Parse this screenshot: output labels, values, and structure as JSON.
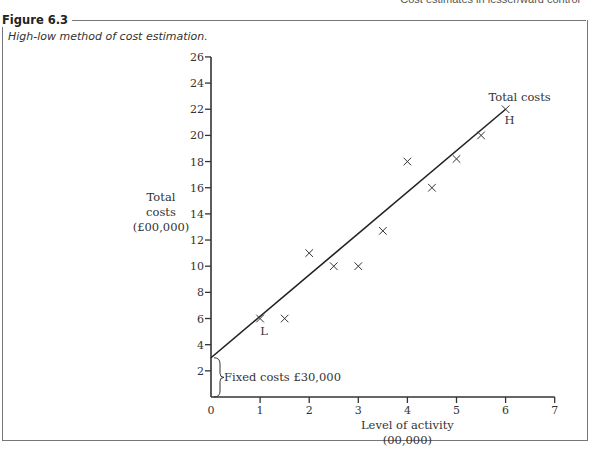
{
  "page": {
    "running_header": "Cost estimates in lesser/ward control"
  },
  "figure": {
    "label": "Figure 6.3",
    "caption": "High-low method of cost estimation."
  },
  "chart_data": {
    "type": "scatter",
    "title": "High-low method of cost estimation.",
    "xlabel": "Level of activity (00,000)",
    "xlabel_lines": [
      "Level of activity",
      "(00,000)"
    ],
    "ylabel": "Total costs (£00,000)",
    "ylabel_lines": [
      "Total",
      "costs",
      "(£00,000)"
    ],
    "xlim": [
      0,
      7
    ],
    "ylim": [
      0,
      26
    ],
    "x_ticks": [
      0,
      1,
      2,
      3,
      4,
      5,
      6,
      7
    ],
    "y_ticks": [
      2,
      4,
      6,
      8,
      10,
      12,
      14,
      16,
      18,
      20,
      22,
      24,
      26
    ],
    "grid": false,
    "series": [
      {
        "name": "Observations",
        "marker": "x",
        "points": [
          {
            "x": 1,
            "y": 6,
            "label": "L"
          },
          {
            "x": 1.5,
            "y": 6
          },
          {
            "x": 2,
            "y": 11
          },
          {
            "x": 2.5,
            "y": 10
          },
          {
            "x": 3,
            "y": 10
          },
          {
            "x": 3.5,
            "y": 12.7
          },
          {
            "x": 4,
            "y": 18
          },
          {
            "x": 4.5,
            "y": 16
          },
          {
            "x": 5,
            "y": 18.2
          },
          {
            "x": 5.5,
            "y": 20
          },
          {
            "x": 6,
            "y": 22,
            "label": "H"
          }
        ]
      },
      {
        "name": "Total costs",
        "type": "line",
        "points": [
          {
            "x": 0,
            "y": 3
          },
          {
            "x": 6,
            "y": 22
          }
        ]
      }
    ],
    "annotations": [
      {
        "text": "Total costs",
        "x": 6,
        "y": 22.5
      },
      {
        "text": "H",
        "x": 6,
        "y": 21
      },
      {
        "text": "L",
        "x": 1,
        "y": 5
      },
      {
        "text": "Fixed costs £30,000",
        "x": 0.1,
        "y": 1.5,
        "bracket_y_range": [
          0,
          3
        ]
      }
    ]
  }
}
